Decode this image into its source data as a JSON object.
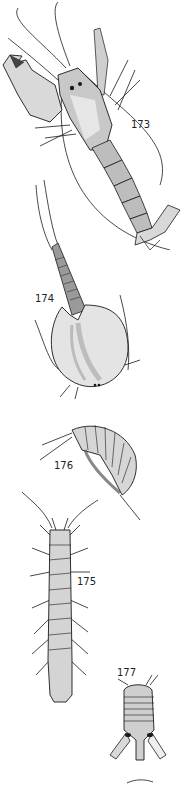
{
  "plate": {
    "background": "#ffffff",
    "ink": "#1a1a1a",
    "figures": [
      {
        "number": "173",
        "subject": "shrimp",
        "label_pos": [
          131,
          125
        ]
      },
      {
        "number": "174",
        "subject": "tadpole-shrimp-carapace",
        "label_pos": [
          35,
          292
        ]
      },
      {
        "number": "176",
        "subject": "amphipod",
        "label_pos": [
          54,
          460
        ]
      },
      {
        "number": "175",
        "subject": "isopod-elongate",
        "label_pos": [
          77,
          582
        ]
      },
      {
        "number": "177",
        "subject": "isopod-small",
        "label_pos": [
          117,
          667
        ]
      }
    ]
  }
}
